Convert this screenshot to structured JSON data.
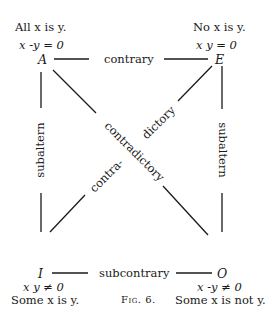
{
  "figure": {
    "caption": "Fig. 6.",
    "corners": {
      "A": {
        "letter": "A",
        "statement": "All x is y.",
        "equation": "x -y = 0"
      },
      "E": {
        "letter": "E",
        "statement": "No x is y.",
        "equation": "x y = 0"
      },
      "I": {
        "letter": "I",
        "statement": "Some x is y.",
        "equation": "x y ≠ 0"
      },
      "O": {
        "letter": "O",
        "statement": "Some x is not y.",
        "equation": "x -y ≠ 0"
      }
    },
    "relations": {
      "top": "contrary",
      "bottom": "subcontrary",
      "left": "subaltern",
      "right": "subaltern",
      "diag_main": "contradictory",
      "diag_part1": "contra-",
      "diag_part2": "dictory"
    }
  }
}
